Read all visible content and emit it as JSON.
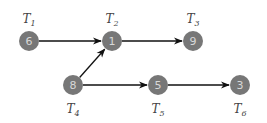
{
  "diagram": {
    "type": "task-dependency-graph",
    "colors": {
      "node_fill": "#777777",
      "node_text": "#d8d8d8",
      "edge": "#111111",
      "label": "#444444"
    },
    "nodes": [
      {
        "id": "T1",
        "label_main": "T",
        "label_sub": "1",
        "value": "6",
        "x": 29,
        "y": 41,
        "label_pos": "above"
      },
      {
        "id": "T2",
        "label_main": "T",
        "label_sub": "2",
        "value": "1",
        "x": 112,
        "y": 41,
        "label_pos": "above"
      },
      {
        "id": "T3",
        "label_main": "T",
        "label_sub": "3",
        "value": "9",
        "x": 193,
        "y": 41,
        "label_pos": "above"
      },
      {
        "id": "T4",
        "label_main": "T",
        "label_sub": "4",
        "value": "8",
        "x": 73,
        "y": 85,
        "label_pos": "below"
      },
      {
        "id": "T5",
        "label_main": "T",
        "label_sub": "5",
        "value": "5",
        "x": 158,
        "y": 85,
        "label_pos": "below"
      },
      {
        "id": "T6",
        "label_main": "T",
        "label_sub": "6",
        "value": "3",
        "x": 240,
        "y": 85,
        "label_pos": "below"
      }
    ],
    "edges": [
      {
        "from": "T1",
        "to": "T2"
      },
      {
        "from": "T2",
        "to": "T3"
      },
      {
        "from": "T4",
        "to": "T2"
      },
      {
        "from": "T4",
        "to": "T5"
      },
      {
        "from": "T5",
        "to": "T6"
      }
    ]
  }
}
